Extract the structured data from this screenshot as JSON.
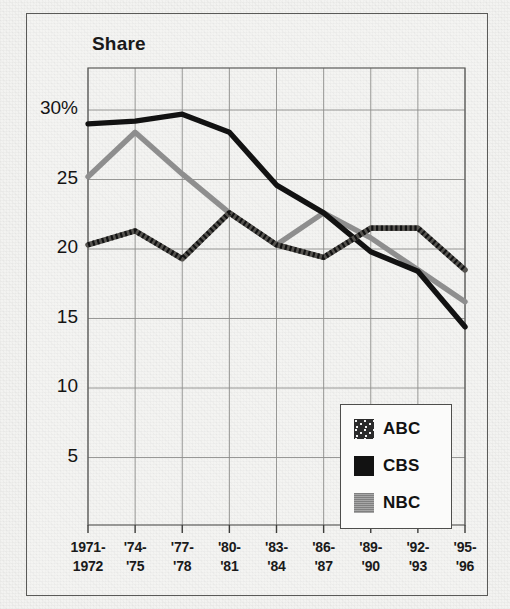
{
  "figure": {
    "title": "Share",
    "border_color": "#5a5a58",
    "background": "#f3f3f1"
  },
  "legend": {
    "position": "inside-bottom-right",
    "entries": [
      {
        "label": "ABC",
        "swatch": "dotted-dark-swatch",
        "color": "#2b2b2b"
      },
      {
        "label": "CBS",
        "swatch": "solid-black-swatch",
        "color": "#121212"
      },
      {
        "label": "NBC",
        "swatch": "gray-swatch",
        "color": "#8e8e8e"
      }
    ]
  },
  "axes": {
    "y_tick_labels": [
      "30%",
      "25",
      "20",
      "15",
      "10",
      "5"
    ],
    "x_tick_labels_top": [
      "1971-",
      "'74-",
      "'77-",
      "'80-",
      "'83-",
      "'86-",
      "'89-",
      "'92-",
      "'95-"
    ],
    "x_tick_labels_bottom": [
      "1972",
      "'75",
      "'78",
      "'81",
      "'84",
      "'87",
      "'90",
      "'93",
      "'96"
    ]
  },
  "chart_data": {
    "type": "line",
    "title": "Share",
    "xlabel": "",
    "ylabel": "Share",
    "grid": true,
    "legend_position": "lower right",
    "ylim": [
      0,
      32.5
    ],
    "yticks": [
      5,
      10,
      15,
      20,
      25,
      30
    ],
    "ytick_labels": [
      "5",
      "10",
      "15",
      "20",
      "25",
      "30%"
    ],
    "categories": [
      "1971-1972",
      "'74-'75",
      "'77-'78",
      "'80-'81",
      "'83-'84",
      "'86-'87",
      "'89-'90",
      "'92-'93",
      "'95-'96"
    ],
    "series": [
      {
        "name": "ABC",
        "color": "#2b2b2b",
        "style": "dotted",
        "values": [
          20.3,
          21.3,
          19.3,
          22.6,
          20.3,
          19.4,
          21.5,
          21.5,
          18.5
        ]
      },
      {
        "name": "CBS",
        "color": "#121212",
        "style": "solid",
        "values": [
          29.0,
          29.2,
          29.7,
          28.4,
          24.6,
          22.6,
          19.8,
          18.4,
          14.4
        ]
      },
      {
        "name": "NBC",
        "color": "#8e8e8e",
        "style": "solid",
        "values": [
          25.2,
          28.4,
          25.4,
          22.6,
          20.3,
          22.6,
          20.8,
          18.5,
          16.2
        ]
      }
    ]
  }
}
